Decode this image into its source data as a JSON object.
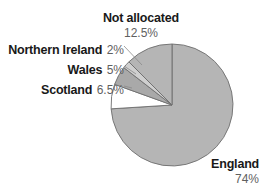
{
  "chart_data": {
    "type": "pie",
    "title": "",
    "subtitle": "",
    "xlabel": "",
    "ylabel": "",
    "legend_position": "callout-labels",
    "grid": false,
    "units": "percent",
    "start_angle_deg": 0,
    "direction": "clockwise",
    "categories": [
      "England",
      "Not allocated",
      "Northern Ireland",
      "Wales",
      "Scotland"
    ],
    "values": [
      74,
      12.5,
      2,
      5,
      6.5
    ],
    "slices": [
      {
        "name": "England",
        "value": 74,
        "value_label": "74%",
        "color": "#b5b5b5",
        "start_deg": 0,
        "end_deg": 266.4
      },
      {
        "name": "Scotland",
        "value": 6.5,
        "value_label": "6.5%",
        "color": "#ffffff",
        "start_deg": 266.4,
        "end_deg": 289.8
      },
      {
        "name": "Wales",
        "value": 5,
        "value_label": "5%",
        "color": "#a9a9a9",
        "start_deg": 289.8,
        "end_deg": 307.8
      },
      {
        "name": "Northern Ireland",
        "value": 2,
        "value_label": "2%",
        "color": "#cfcfcf",
        "start_deg": 307.8,
        "end_deg": 315.0
      },
      {
        "name": "Not allocated",
        "value": 12.5,
        "value_label": "12.5%",
        "color": "#b5b5b5",
        "start_deg": 315.0,
        "end_deg": 360.0
      }
    ],
    "colors": {
      "main_fill": "#b5b5b5",
      "light_fill": "#cfcfcf",
      "mid_fill": "#a9a9a9",
      "white_fill": "#ffffff",
      "outline": "#6e6e6e",
      "label_text": "#191919",
      "value_text": "#5f5f5f",
      "background": "#ffffff"
    }
  },
  "labels": {
    "not_allocated": {
      "name": "Not allocated",
      "value": "12.5%"
    },
    "northern_ireland": {
      "name": "Northern Ireland",
      "value": "2%"
    },
    "wales": {
      "name": "Wales",
      "value": "5%"
    },
    "scotland": {
      "name": "Scotland",
      "value": "6.5%"
    },
    "england": {
      "name": "England",
      "value": "74%"
    }
  }
}
